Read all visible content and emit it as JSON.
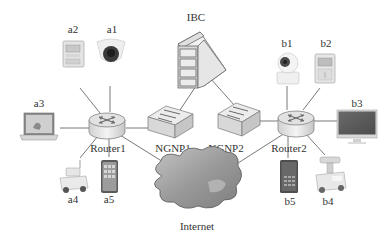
{
  "diagram": {
    "type": "network-topology",
    "nodes": {
      "ibc": {
        "label": "IBC",
        "kind": "server"
      },
      "router1": {
        "label": "Router1",
        "kind": "router"
      },
      "router2": {
        "label": "Router2",
        "kind": "router"
      },
      "ngnp1": {
        "label": "NGNP1",
        "kind": "switch"
      },
      "ngnp2": {
        "label": "NGNP2",
        "kind": "switch"
      },
      "internet": {
        "label": "Internet",
        "kind": "cloud"
      },
      "a1": {
        "label": "a1",
        "kind": "dome-camera"
      },
      "a2": {
        "label": "a2",
        "kind": "smart-meter"
      },
      "a3": {
        "label": "a3",
        "kind": "laptop"
      },
      "a4": {
        "label": "a4",
        "kind": "robot-vehicle"
      },
      "a5": {
        "label": "a5",
        "kind": "smartphone"
      },
      "b1": {
        "label": "b1",
        "kind": "ip-camera"
      },
      "b2": {
        "label": "b2",
        "kind": "smart-meter"
      },
      "b3": {
        "label": "b3",
        "kind": "monitor"
      },
      "b4": {
        "label": "b4",
        "kind": "robot-vehicle"
      },
      "b5": {
        "label": "b5",
        "kind": "smartphone"
      }
    },
    "edges": [
      [
        "router1",
        "a1"
      ],
      [
        "router1",
        "a2"
      ],
      [
        "router1",
        "a3"
      ],
      [
        "router1",
        "a4"
      ],
      [
        "router1",
        "a5"
      ],
      [
        "router1",
        "ngnp1"
      ],
      [
        "router1",
        "internet"
      ],
      [
        "ngnp1",
        "ibc"
      ],
      [
        "ngnp2",
        "ibc"
      ],
      [
        "router2",
        "ngnp2"
      ],
      [
        "router2",
        "internet"
      ],
      [
        "router2",
        "b1"
      ],
      [
        "router2",
        "b2"
      ],
      [
        "router2",
        "b3"
      ],
      [
        "router2",
        "b4"
      ],
      [
        "router2",
        "b5"
      ]
    ]
  }
}
